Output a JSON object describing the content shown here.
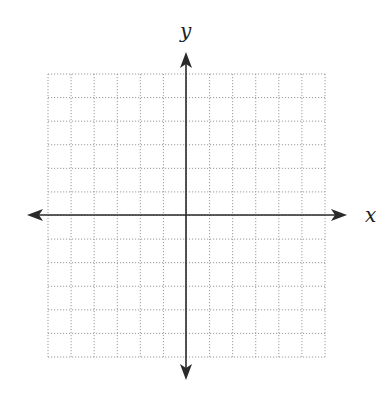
{
  "diagram": {
    "type": "coordinate-plane",
    "x_axis_label": "x",
    "y_axis_label": "y",
    "grid": {
      "columns": 12,
      "rows": 12,
      "left": 48,
      "top": 74,
      "right": 325,
      "bottom": 357,
      "line_style": "dotted",
      "line_color": "#9a9a9a"
    },
    "axes": {
      "origin_x": 186,
      "origin_y": 215,
      "x_start": 27,
      "x_end": 347,
      "y_start": 52,
      "y_end": 380,
      "color": "#2a2a2a"
    },
    "labels": {
      "x": {
        "text": "x",
        "left": 365,
        "top": 222
      },
      "y": {
        "text": "y",
        "left": 180,
        "top": 38
      }
    }
  }
}
